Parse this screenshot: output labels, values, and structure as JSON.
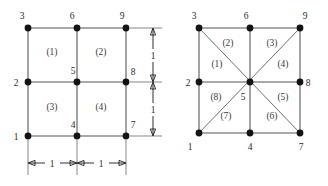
{
  "figure": {
    "caption": "",
    "background_color": "#ffffff",
    "line_color": "#8c8c8c",
    "diagonal_color": "#6f6f6f",
    "node_color": "#131313",
    "text_color": "#2b2b2b"
  },
  "left_mesh": {
    "name": "quadrilateral-mesh",
    "element_type": "quadrilateral",
    "node_count": 9,
    "element_count": 4,
    "nodes": [
      {
        "id": "1",
        "label": "1",
        "x": 28,
        "y": 136,
        "label_x": 16,
        "label_y": 140
      },
      {
        "id": "2",
        "label": "2",
        "x": 28,
        "y": 82,
        "label_x": 16,
        "label_y": 86
      },
      {
        "id": "3",
        "label": "3",
        "x": 28,
        "y": 28,
        "label_x": 22,
        "label_y": 18
      },
      {
        "id": "4",
        "label": "4",
        "x": 77,
        "y": 136,
        "label_x": 73,
        "label_y": 127
      },
      {
        "id": "5",
        "label": "5",
        "x": 77,
        "y": 82,
        "label_x": 73,
        "label_y": 73
      },
      {
        "id": "6",
        "label": "6",
        "x": 77,
        "y": 28,
        "label_x": 72,
        "label_y": 18
      },
      {
        "id": "7",
        "label": "7",
        "x": 126,
        "y": 136,
        "label_x": 131,
        "label_y": 127
      },
      {
        "id": "8",
        "label": "8",
        "x": 126,
        "y": 82,
        "label_x": 131,
        "label_y": 74
      },
      {
        "id": "9",
        "label": "9",
        "x": 126,
        "y": 28,
        "label_x": 122,
        "label_y": 18
      }
    ],
    "elements": [
      {
        "id": "1",
        "label": "(1)",
        "cx": 52,
        "cy": 55,
        "nodes": [
          "2",
          "5",
          "6",
          "3"
        ]
      },
      {
        "id": "2",
        "label": "(2)",
        "cx": 101,
        "cy": 55,
        "nodes": [
          "5",
          "8",
          "9",
          "6"
        ]
      },
      {
        "id": "3",
        "label": "(3)",
        "cx": 52,
        "cy": 110,
        "nodes": [
          "1",
          "4",
          "5",
          "2"
        ]
      },
      {
        "id": "4",
        "label": "(4)",
        "cx": 101,
        "cy": 110,
        "nodes": [
          "4",
          "7",
          "8",
          "5"
        ]
      }
    ],
    "dimensions": [
      {
        "id": "width-left",
        "label": "1",
        "orientation": "horizontal",
        "label_x": 52,
        "label_y": 167
      },
      {
        "id": "width-right",
        "label": "1",
        "orientation": "horizontal",
        "label_x": 101,
        "label_y": 167
      },
      {
        "id": "height-top",
        "label": "1",
        "orientation": "vertical",
        "label_x": 159,
        "label_y": 58
      },
      {
        "id": "height-bottom",
        "label": "1",
        "orientation": "vertical",
        "label_x": 159,
        "label_y": 113
      }
    ]
  },
  "right_mesh": {
    "name": "triangular-mesh",
    "element_type": "triangle",
    "node_count": 9,
    "element_count": 8,
    "nodes": [
      {
        "id": "1",
        "label": "1",
        "x": 199,
        "y": 133,
        "label_x": 189,
        "label_y": 148
      },
      {
        "id": "2",
        "label": "2",
        "x": 199,
        "y": 82,
        "label_x": 187,
        "label_y": 86
      },
      {
        "id": "3",
        "label": "3",
        "x": 199,
        "y": 28,
        "label_x": 194,
        "label_y": 18
      },
      {
        "id": "4",
        "label": "4",
        "x": 250,
        "y": 133,
        "label_x": 246,
        "label_y": 148
      },
      {
        "id": "5",
        "label": "5",
        "x": 250,
        "y": 82,
        "label_x": 243,
        "label_y": 99
      },
      {
        "id": "6",
        "label": "6",
        "x": 250,
        "y": 28,
        "label_x": 245,
        "label_y": 18
      },
      {
        "id": "7",
        "label": "7",
        "x": 300,
        "y": 133,
        "label_x": 297,
        "label_y": 148
      },
      {
        "id": "8",
        "label": "8",
        "x": 300,
        "y": 82,
        "label_x": 306,
        "label_y": 86
      },
      {
        "id": "9",
        "label": "9",
        "x": 300,
        "y": 28,
        "label_x": 304,
        "label_y": 18
      }
    ],
    "elements": [
      {
        "id": "1",
        "label": "(1)",
        "cx": 217,
        "cy": 67,
        "nodes": [
          "2",
          "5",
          "3"
        ]
      },
      {
        "id": "2",
        "label": "(2)",
        "cx": 228,
        "cy": 45,
        "nodes": [
          "3",
          "5",
          "6"
        ]
      },
      {
        "id": "3",
        "label": "(3)",
        "cx": 271,
        "cy": 45,
        "nodes": [
          "6",
          "5",
          "9"
        ]
      },
      {
        "id": "4",
        "label": "(4)",
        "cx": 283,
        "cy": 67,
        "nodes": [
          "9",
          "5",
          "8"
        ]
      },
      {
        "id": "5",
        "label": "(5)",
        "cx": 283,
        "cy": 99,
        "nodes": [
          "8",
          "5",
          "7"
        ]
      },
      {
        "id": "6",
        "label": "(6)",
        "cx": 271,
        "cy": 118,
        "nodes": [
          "7",
          "5",
          "4"
        ]
      },
      {
        "id": "7",
        "label": "(7)",
        "cx": 226,
        "cy": 118,
        "nodes": [
          "4",
          "5",
          "1"
        ]
      },
      {
        "id": "8",
        "label": "(8)",
        "cx": 216,
        "cy": 99,
        "nodes": [
          "1",
          "5",
          "2"
        ]
      }
    ]
  }
}
